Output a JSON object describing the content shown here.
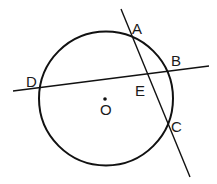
{
  "diagram": {
    "circle": {
      "cx": 106,
      "cy": 98.5,
      "r": 67,
      "stroke": "#111111"
    },
    "center_point": {
      "x": 105,
      "y": 99
    },
    "lines": [
      {
        "name": "line-AC",
        "x1": 121,
        "y1": 9,
        "x2": 190,
        "y2": 177
      },
      {
        "name": "line-DB",
        "x1": 13,
        "y1": 91,
        "x2": 209,
        "y2": 66
      }
    ],
    "labels": {
      "A": "A",
      "B": "B",
      "C": "C",
      "D": "D",
      "E": "E",
      "O": "O"
    }
  }
}
